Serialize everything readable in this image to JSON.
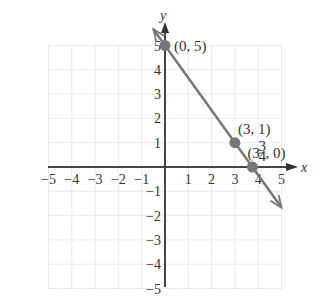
{
  "chart_data": {
    "type": "line",
    "title": "",
    "xlabel": "x",
    "ylabel": "y",
    "xlim": [
      -5,
      5
    ],
    "ylim": [
      -5,
      5
    ],
    "grid": true,
    "x_ticks": [
      "-5",
      "-4",
      "-3",
      "-2",
      "-1",
      "1",
      "2",
      "3",
      "4",
      "5"
    ],
    "y_ticks": [
      "5",
      "4",
      "3",
      "2",
      "1",
      "-1",
      "-2",
      "-3",
      "-4",
      "-5"
    ],
    "series": [
      {
        "name": "line",
        "x": [
          -0.5,
          5
        ],
        "y": [
          5.67,
          -1.67
        ],
        "color": "#777777"
      }
    ],
    "points": [
      {
        "x": 0,
        "y": 5,
        "label": "(0, 5)"
      },
      {
        "x": 3,
        "y": 1,
        "label": "(3, 1)"
      },
      {
        "x": 3.75,
        "y": 0,
        "label_whole": "(3",
        "label_num": "3",
        "label_den": "4",
        "label_tail": ", 0)"
      }
    ],
    "colors": {
      "grid": "#d8d8d8",
      "axis": "#444444",
      "line": "#777777",
      "point": "#777777"
    }
  }
}
